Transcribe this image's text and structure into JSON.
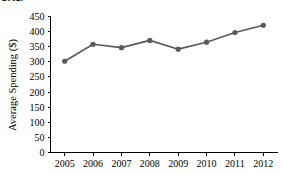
{
  "figure": {
    "cropped_caption_remnant": "2012.",
    "background_color": "#ffffff"
  },
  "chart_data": {
    "type": "line",
    "title": "",
    "subtitle": "",
    "xlabel": "",
    "ylabel": "Average Spending ($)",
    "categories": [
      "2005",
      "2006",
      "2007",
      "2008",
      "2009",
      "2010",
      "2011",
      "2012"
    ],
    "values": [
      302,
      358,
      347,
      371,
      342,
      365,
      397,
      421
    ],
    "series": [
      {
        "name": "Average Spending",
        "values": [
          302,
          358,
          347,
          371,
          342,
          365,
          397,
          421
        ],
        "color": "#5a5a5a",
        "marker": "circle"
      }
    ],
    "ylim": [
      0,
      450
    ],
    "y_ticks": [
      0,
      50,
      100,
      150,
      200,
      250,
      300,
      350,
      400,
      450
    ],
    "y_tick_labels": [
      "0",
      "50",
      "100",
      "150",
      "200",
      "250",
      "300",
      "350",
      "400",
      "450"
    ],
    "x_tick_labels": [
      "2005",
      "2006",
      "2007",
      "2008",
      "2009",
      "2010",
      "2011",
      "2012"
    ],
    "grid": false,
    "legend": false,
    "legend_position": "none",
    "line_color": "#5a5a5a",
    "marker_color": "#5a5a5a",
    "axis_color": "#000000"
  }
}
